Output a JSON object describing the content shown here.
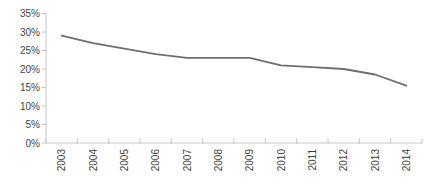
{
  "chart_data": {
    "type": "line",
    "title": "",
    "xlabel": "",
    "ylabel": "",
    "categories": [
      "2003",
      "2004",
      "2005",
      "2006",
      "2007",
      "2008",
      "2009",
      "2010",
      "2011",
      "2012",
      "2013",
      "2014"
    ],
    "series": [
      {
        "name": "percentage-trend",
        "values": [
          29,
          27,
          25.5,
          24,
          23,
          23,
          23,
          21,
          20.5,
          20,
          18.5,
          15.5
        ]
      }
    ],
    "ylim": [
      0,
      35
    ],
    "ytick_interval": 5,
    "ytick_labels": [
      "0%",
      "5%",
      "10%",
      "15%",
      "20%",
      "25%",
      "30%",
      "35%"
    ],
    "grid": false,
    "legend": false,
    "colors": {
      "line": "#6e6e6e",
      "axis": "#c6c6c6",
      "tick": "#c6c6c6",
      "label": "#3f3f3f",
      "background": "#ffffff"
    }
  }
}
